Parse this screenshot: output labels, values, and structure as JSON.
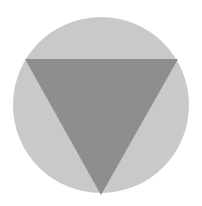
{
  "icon": {
    "name": "circle-with-inverted-triangle",
    "background_color": "#ffffff",
    "circle": {
      "cx": 101,
      "cy": 105,
      "r": 88,
      "fill": "#c9c9c9"
    },
    "triangle": {
      "points": "25,59 178,59 101,195",
      "fill": "#8e8e8e"
    }
  }
}
